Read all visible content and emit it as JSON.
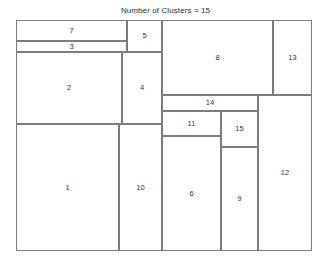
{
  "chart_data": {
    "type": "treemap",
    "title": "Number of Clusters = 15",
    "xlabel": "",
    "ylabel": "",
    "grid": false,
    "legend": false,
    "plot_bounds": {
      "x0": 17,
      "y0": 21,
      "x1": 313,
      "y1": 252,
      "width": 296,
      "height": 231
    },
    "units": "pixels",
    "colors": {
      "border": "#7d7d7d",
      "fill": "#ffffff",
      "label": "#353535",
      "title": "#2b2b2b"
    },
    "categories": [
      "1",
      "2",
      "3",
      "4",
      "5",
      "6",
      "7",
      "8",
      "9",
      "10",
      "11",
      "12",
      "13",
      "14",
      "15"
    ],
    "values": [
      13081,
      7632,
      1133,
      5760,
      1120,
      6785,
      2331,
      8325,
      3848,
      5547,
      1475,
      8424,
      2925,
      1536,
      1332
    ],
    "rects": [
      {
        "label": "7",
        "x": 0,
        "y": 0,
        "w": 111,
        "h": 21,
        "area": 2331
      },
      {
        "label": "3",
        "x": 0,
        "y": 21,
        "w": 111,
        "h": 11,
        "area": 1133
      },
      {
        "label": "5",
        "x": 111,
        "y": 0,
        "w": 35,
        "h": 32,
        "area": 1120
      },
      {
        "label": "2",
        "x": 0,
        "y": 32,
        "w": 106,
        "h": 72,
        "area": 7632
      },
      {
        "label": "4",
        "x": 106,
        "y": 32,
        "w": 40,
        "h": 72,
        "area": 5760
      },
      {
        "label": "1",
        "x": 0,
        "y": 104,
        "w": 103,
        "h": 127,
        "area": 13081
      },
      {
        "label": "10",
        "x": 103,
        "y": 104,
        "w": 43,
        "h": 127,
        "area": 5547
      },
      {
        "label": "8",
        "x": 146,
        "y": 0,
        "w": 111,
        "h": 75,
        "area": 8325
      },
      {
        "label": "13",
        "x": 257,
        "y": 0,
        "w": 39,
        "h": 75,
        "area": 2925
      },
      {
        "label": "14",
        "x": 146,
        "y": 75,
        "w": 96,
        "h": 16,
        "area": 1536
      },
      {
        "label": "11",
        "x": 146,
        "y": 91,
        "w": 59,
        "h": 25,
        "area": 1475
      },
      {
        "label": "15",
        "x": 205,
        "y": 91,
        "w": 37,
        "h": 36,
        "area": 1332
      },
      {
        "label": "6",
        "x": 146,
        "y": 116,
        "w": 59,
        "h": 115,
        "area": 6785
      },
      {
        "label": "9",
        "x": 205,
        "y": 127,
        "w": 37,
        "h": 104,
        "area": 3848
      },
      {
        "label": "12",
        "x": 242,
        "y": 75,
        "w": 54,
        "h": 156,
        "area": 8424
      }
    ]
  }
}
